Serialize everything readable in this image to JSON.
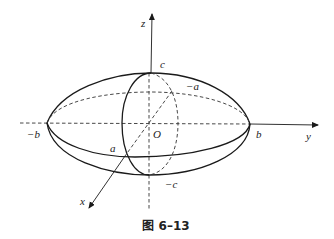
{
  "figure": {
    "caption": "图 6–13",
    "axes": {
      "x": "x",
      "y": "y",
      "z": "z",
      "origin": "O"
    },
    "intercepts": {
      "c_pos": "c",
      "c_neg": "−c",
      "b_pos": "b",
      "b_neg": "−b",
      "a_pos": "a",
      "a_neg": "−a"
    }
  }
}
